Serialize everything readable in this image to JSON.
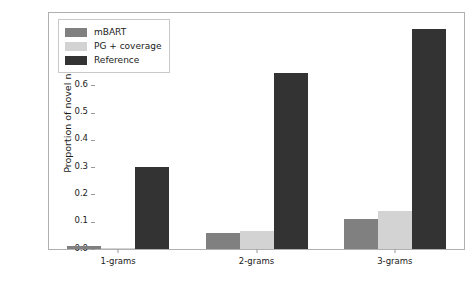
{
  "chart_data": {
    "type": "bar",
    "title": "",
    "xlabel": "",
    "ylabel": "Proportion of novel n-grams",
    "categories": [
      "1-grams",
      "2-grams",
      "3-grams"
    ],
    "series": [
      {
        "name": "mBART",
        "color": "#808080",
        "values": [
          0.01,
          0.058,
          0.11
        ]
      },
      {
        "name": "PG + coverage",
        "color": "#d3d3d3",
        "values": [
          0.005,
          0.066,
          0.14
        ]
      },
      {
        "name": "Reference",
        "color": "#333333",
        "values": [
          0.3,
          0.645,
          0.805
        ]
      }
    ],
    "ylim": [
      0.0,
      0.865
    ],
    "yticks": [
      0.0,
      0.1,
      0.2,
      0.3,
      0.4,
      0.5,
      0.6,
      0.7,
      0.8
    ],
    "ytick_labels": [
      "0.0",
      "0.1",
      "0.2",
      "0.3",
      "0.4",
      "0.5",
      "0.6",
      "0.7",
      "0.8"
    ],
    "grid": false,
    "legend_position": "upper left"
  }
}
